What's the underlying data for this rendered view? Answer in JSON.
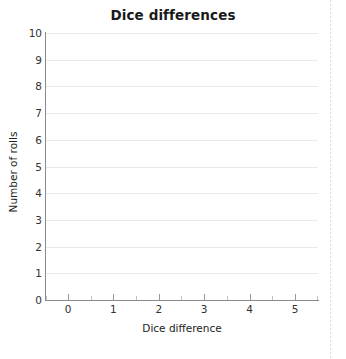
{
  "chart_data": {
    "type": "bar",
    "title": "Dice differences",
    "xlabel": "Dice difference",
    "ylabel": "Number of rolls",
    "categories": [
      "0",
      "1",
      "2",
      "3",
      "4",
      "5"
    ],
    "values": [
      0,
      0,
      0,
      0,
      0,
      0
    ],
    "series": [
      {
        "name": "Number of rolls",
        "values": [
          0,
          0,
          0,
          0,
          0,
          0
        ]
      }
    ],
    "ylim": [
      0,
      10
    ],
    "xlim": [
      -0.5,
      5.5
    ],
    "y_ticks": [
      "10",
      "9",
      "8",
      "7",
      "6",
      "5",
      "4",
      "3",
      "2",
      "1",
      "0"
    ],
    "x_ticks": [
      "0",
      "1",
      "2",
      "3",
      "4",
      "5"
    ],
    "grid": "horizontal",
    "legend": "none",
    "annotations": [],
    "note": "Empty chart template - no bars drawn, all categories at zero"
  },
  "axes": {
    "y": {
      "title": "Number of rolls",
      "ticks": [
        {
          "label": "10",
          "value": 10
        },
        {
          "label": "9",
          "value": 9
        },
        {
          "label": "8",
          "value": 8
        },
        {
          "label": "7",
          "value": 7
        },
        {
          "label": "6",
          "value": 6
        },
        {
          "label": "5",
          "value": 5
        },
        {
          "label": "4",
          "value": 4
        },
        {
          "label": "3",
          "value": 3
        },
        {
          "label": "2",
          "value": 2
        },
        {
          "label": "1",
          "value": 1
        },
        {
          "label": "0",
          "value": 0
        }
      ]
    },
    "x": {
      "title": "Dice difference",
      "ticks": [
        {
          "label": "0",
          "value": 0
        },
        {
          "label": "1",
          "value": 1
        },
        {
          "label": "2",
          "value": 2
        },
        {
          "label": "3",
          "value": 3
        },
        {
          "label": "4",
          "value": 4
        },
        {
          "label": "5",
          "value": 5
        }
      ]
    }
  },
  "colors": {
    "axis": "#8a8a8a",
    "grid": "#e9e9e9",
    "text": "#333333",
    "title": "#1a1a1a",
    "bar": "#4a77b4",
    "background": "#ffffff"
  }
}
